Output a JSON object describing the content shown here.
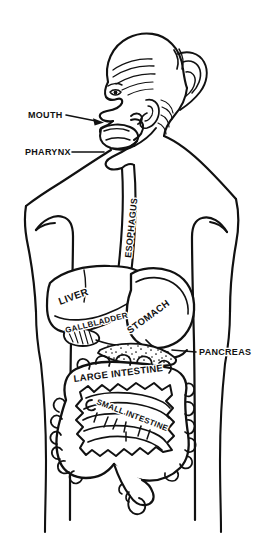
{
  "figure": {
    "background_color": "#ffffff",
    "ink_color": "#111111",
    "width": 266,
    "height": 542
  },
  "labels": {
    "mouth": {
      "text": "MOUTH",
      "x": 28,
      "y": 118,
      "rotation": 0,
      "font_size": 9,
      "leader": "arrow-right"
    },
    "pharynx": {
      "text": "PHARYNX",
      "x": 25,
      "y": 155,
      "rotation": 0,
      "font_size": 9,
      "leader": "line-right"
    },
    "esophagus": {
      "text": "ESOPHAGUS",
      "x": 118,
      "y": 222,
      "rotation": -84,
      "font_size": 9,
      "leader": "none"
    },
    "liver": {
      "text": "LIVER",
      "x": 62,
      "y": 302,
      "rotation": -20,
      "font_size": 9,
      "leader": "none"
    },
    "gallbladder": {
      "text": "GALLBLADDER",
      "x": 70,
      "y": 327,
      "rotation": -14,
      "font_size": 8,
      "leader": "none"
    },
    "stomach": {
      "text": "STOMACH",
      "x": 133,
      "y": 330,
      "rotation": -36,
      "font_size": 9,
      "leader": "none"
    },
    "pancreas": {
      "text": "PANCREAS",
      "x": 199,
      "y": 354,
      "rotation": 0,
      "font_size": 9,
      "leader": "line-left"
    },
    "large_intestine": {
      "text": "LARGE INTESTINE",
      "x": 76,
      "y": 379,
      "rotation": -7,
      "font_size": 9,
      "leader": "none"
    },
    "small_intestine": {
      "text": "SMALL INTESTINE",
      "x": 91,
      "y": 403,
      "rotation": 21,
      "font_size": 7.5,
      "leader": "hook-left"
    }
  },
  "organs": [
    {
      "name": "mouth",
      "label": "MOUTH"
    },
    {
      "name": "pharynx",
      "label": "PHARYNX"
    },
    {
      "name": "esophagus",
      "label": "ESOPHAGUS"
    },
    {
      "name": "liver",
      "label": "LIVER"
    },
    {
      "name": "gallbladder",
      "label": "GALLBLADDER"
    },
    {
      "name": "stomach",
      "label": "STOMACH"
    },
    {
      "name": "pancreas",
      "label": "PANCREAS"
    },
    {
      "name": "large-intestine",
      "label": "LARGE INTESTINE"
    },
    {
      "name": "small-intestine",
      "label": "SMALL INTESTINE"
    }
  ]
}
